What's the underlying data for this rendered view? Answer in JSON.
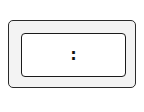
{
  "display": {
    "separator": ":",
    "hours": "",
    "minutes": ""
  },
  "colors": {
    "frame_fill": "#f3f3f3",
    "screen_fill": "#ffffff",
    "stroke": "#1a1a1a"
  }
}
